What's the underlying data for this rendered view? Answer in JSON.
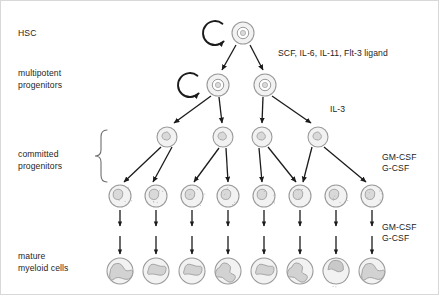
{
  "diagram": {
    "background": "#ffffff",
    "stroke_color": "#1b1b1b",
    "cell_outline_color": "#9a9a9a",
    "cell_fill_color": "#f2f2f2",
    "nucleus_fill_color": "#d9d9d9"
  },
  "stage_labels": [
    {
      "id": "hsc",
      "text": "HSC",
      "x": 18,
      "y": 28
    },
    {
      "id": "multipotent-line1",
      "text": "multipotent",
      "x": 18,
      "y": 68
    },
    {
      "id": "multipotent-line2",
      "text": "progenitors",
      "x": 18,
      "y": 80
    },
    {
      "id": "committed-line1",
      "text": "committed",
      "x": 18,
      "y": 149
    },
    {
      "id": "committed-line2",
      "text": "progenitors",
      "x": 18,
      "y": 161
    },
    {
      "id": "mature-line1",
      "text": "mature",
      "x": 18,
      "y": 251
    },
    {
      "id": "mature-line2",
      "text": "myeloid cells",
      "x": 18,
      "y": 263
    }
  ],
  "cytokine_labels": [
    {
      "id": "scf-group",
      "text": "SCF, IL-6, IL-11, Flt-3 ligand",
      "x": 278,
      "y": 48
    },
    {
      "id": "il3",
      "text": "IL-3",
      "x": 330,
      "y": 104
    },
    {
      "id": "csf-upper-1",
      "text": "GM-CSF",
      "x": 382,
      "y": 152
    },
    {
      "id": "csf-upper-2",
      "text": "G-CSF",
      "x": 382,
      "y": 163
    },
    {
      "id": "csf-lower-1",
      "text": "GM-CSF",
      "x": 382,
      "y": 222
    },
    {
      "id": "csf-lower-2",
      "text": "G-CSF",
      "x": 382,
      "y": 233
    }
  ],
  "rows": {
    "hsc": {
      "label": "HSC",
      "cell_radius": 11,
      "cells": [
        {
          "x": 243,
          "y": 33
        }
      ],
      "self_renewal_arrow": true
    },
    "multipotent": {
      "label": "multipotent progenitors",
      "cell_radius": 11,
      "cells": [
        {
          "x": 218,
          "y": 85
        },
        {
          "x": 265,
          "y": 85
        }
      ],
      "self_renewal_arrow": true
    },
    "committed": {
      "label": "committed progenitors",
      "cell_radius": 10,
      "cells": [
        {
          "x": 167,
          "y": 137
        },
        {
          "x": 223,
          "y": 137
        },
        {
          "x": 262,
          "y": 137
        },
        {
          "x": 318,
          "y": 137
        }
      ]
    },
    "precursors": {
      "label": "precursors",
      "cell_radius": 11,
      "cells": [
        {
          "x": 120,
          "y": 196
        },
        {
          "x": 156,
          "y": 196
        },
        {
          "x": 192,
          "y": 196
        },
        {
          "x": 228,
          "y": 196
        },
        {
          "x": 264,
          "y": 196
        },
        {
          "x": 300,
          "y": 196
        },
        {
          "x": 336,
          "y": 196
        },
        {
          "x": 372,
          "y": 196
        }
      ]
    },
    "mature": {
      "label": "mature myeloid cells",
      "cell_radius": 13,
      "cells": [
        {
          "x": 120,
          "y": 271,
          "nucleus": "s-lobed"
        },
        {
          "x": 156,
          "y": 271,
          "nucleus": "band"
        },
        {
          "x": 192,
          "y": 271,
          "nucleus": "band"
        },
        {
          "x": 228,
          "y": 271,
          "nucleus": "segmented"
        },
        {
          "x": 264,
          "y": 271,
          "nucleus": "band"
        },
        {
          "x": 300,
          "y": 271,
          "nucleus": "segmented"
        },
        {
          "x": 336,
          "y": 271,
          "nucleus": "monocyte"
        },
        {
          "x": 372,
          "y": 271,
          "nucleus": "s-lobed"
        }
      ]
    }
  },
  "brace": {
    "id": "committed-progenitors-brace",
    "x": 100,
    "top": 130,
    "bottom": 182
  },
  "arrows": {
    "hsc_to_multipotent": [
      {
        "x1": 236,
        "y1": 45,
        "x2": 222,
        "y2": 70
      },
      {
        "x1": 250,
        "y1": 45,
        "x2": 263,
        "y2": 70
      }
    ],
    "multipotent_to_committed": [
      {
        "x1": 211,
        "y1": 96,
        "x2": 174,
        "y2": 123
      },
      {
        "x1": 219,
        "y1": 97,
        "x2": 222,
        "y2": 123
      },
      {
        "x1": 263,
        "y1": 97,
        "x2": 262,
        "y2": 123
      },
      {
        "x1": 272,
        "y1": 96,
        "x2": 311,
        "y2": 123
      }
    ],
    "committed_to_precursors": [
      {
        "x1": 161,
        "y1": 147,
        "x2": 124,
        "y2": 182
      },
      {
        "x1": 172,
        "y1": 147,
        "x2": 153,
        "y2": 182
      },
      {
        "x1": 219,
        "y1": 148,
        "x2": 194,
        "y2": 182
      },
      {
        "x1": 226,
        "y1": 148,
        "x2": 228,
        "y2": 182
      },
      {
        "x1": 259,
        "y1": 148,
        "x2": 262,
        "y2": 182
      },
      {
        "x1": 268,
        "y1": 147,
        "x2": 296,
        "y2": 182
      },
      {
        "x1": 312,
        "y1": 147,
        "x2": 303,
        "y2": 182
      },
      {
        "x1": 324,
        "y1": 147,
        "x2": 366,
        "y2": 182
      }
    ],
    "precursor_chain_rows": [
      {
        "y1": 210,
        "y2": 226
      },
      {
        "y1": 236,
        "y2": 254
      }
    ]
  }
}
